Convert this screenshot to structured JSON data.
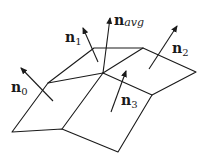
{
  "diagram": {
    "stroke_color": "#1a1a1a",
    "background": "#ffffff",
    "labels": {
      "n0": {
        "base": "n",
        "sub": "0"
      },
      "n1": {
        "base": "n",
        "sub": "1"
      },
      "n2": {
        "base": "n",
        "sub": "2"
      },
      "n3": {
        "base": "n",
        "sub": "3"
      },
      "navg": {
        "base": "n",
        "sub": "avg"
      }
    }
  }
}
